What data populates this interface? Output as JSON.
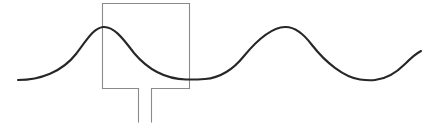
{
  "canvas": {
    "width": 434,
    "height": 125,
    "background_color": "#ffffff",
    "figure_kind": "line-drawing-schematic",
    "description": "Dark sinusoidal wave overlapping a gray open-bottom rectangle with two downward stems"
  },
  "colors": {
    "wave_stroke": "#272727",
    "rect_stroke": "#8a8a8a",
    "stem_stroke": "#8a8a8a",
    "background": "#ffffff"
  },
  "strokes": {
    "wave_width": 2.1,
    "rect_width": 1.1,
    "stem_width": 1.1
  },
  "wave": {
    "label": "sine-wave",
    "start": {
      "x": 18,
      "y": 80
    },
    "end": {
      "x": 421,
      "y": 51
    },
    "peaks": [
      {
        "x": 103,
        "y": 27
      },
      {
        "x": 293,
        "y": 27
      }
    ],
    "troughs": [
      {
        "x": 205,
        "y": 79
      },
      {
        "x": 375,
        "y": 80
      }
    ],
    "path": "M 18,80 C 40,80 62,72 76,54 C 88,38 94,28 103,27 C 113,26 122,37 134,53 C 150,72 168,79 186,79.5 C 196,79.7 201,79.3 205,79 C 218,78 232,71 244,56 C 258,39 272,27.5 285,27 C 295,26.6 303,33 312,45 C 326,63 344,77 360,79.5 C 367,80.5 372,80.3 375,80 C 386,79 396,73 405,64 C 412,57 417,53 421,51"
  },
  "rectangle": {
    "label": "open-bottom-rectangle",
    "left": 102.5,
    "right": 189.5,
    "top": 3.5,
    "bottom": 88.5,
    "gap_left": 138.5,
    "gap_right": 151.5,
    "segments": [
      {
        "name": "top-edge",
        "x1": 102.5,
        "y1": 3.5,
        "x2": 189.5,
        "y2": 3.5
      },
      {
        "name": "left-edge",
        "x1": 102.5,
        "y1": 3.5,
        "x2": 102.5,
        "y2": 88.5
      },
      {
        "name": "right-edge",
        "x1": 189.5,
        "y1": 3.5,
        "x2": 189.5,
        "y2": 88.5
      },
      {
        "name": "bottom-edge-left",
        "x1": 102.5,
        "y1": 88.5,
        "x2": 138.5,
        "y2": 88.5
      },
      {
        "name": "bottom-edge-right",
        "x1": 151.5,
        "y1": 88.5,
        "x2": 189.5,
        "y2": 88.5
      }
    ]
  },
  "stems": {
    "label": "downward-stems",
    "count": 2,
    "items": [
      {
        "name": "stem-left",
        "x": 138.5,
        "y_top": 88.5,
        "y_bottom": 122
      },
      {
        "name": "stem-right",
        "x": 151.5,
        "y_top": 88.5,
        "y_bottom": 122
      }
    ]
  }
}
